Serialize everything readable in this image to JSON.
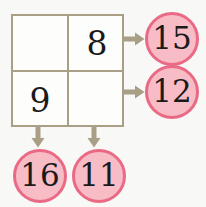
{
  "puzzle": {
    "title": "Addition grid puzzle",
    "background_color": "#f8f8f6",
    "grid_border_color": "#a99f87",
    "circle_fill_color": "#f7bcc6",
    "circle_border_color": "#ea6a86",
    "arrow_color": "#a99f87",
    "digit_color": "#1a1a1a"
  },
  "grid": {
    "rows": 2,
    "cols": 2,
    "cells": [
      [
        {
          "value": "",
          "filled": false
        },
        {
          "value": "8",
          "filled": true
        }
      ],
      [
        {
          "value": "9",
          "filled": true
        },
        {
          "value": "",
          "filled": false
        }
      ]
    ]
  },
  "row_sums": [
    {
      "value": "15",
      "arrow": "arrow-right-icon"
    },
    {
      "value": "12",
      "arrow": "arrow-right-icon"
    }
  ],
  "col_sums": [
    {
      "value": "16",
      "arrow": "arrow-down-icon"
    },
    {
      "value": "11",
      "arrow": "arrow-down-icon"
    }
  ]
}
